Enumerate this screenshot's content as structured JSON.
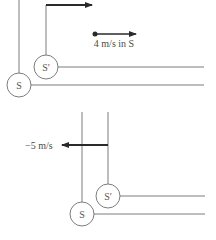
{
  "diagram": {
    "panels": [
      {
        "name": "top",
        "frames": [
          {
            "id": "S",
            "label": "S"
          },
          {
            "id": "S_prime",
            "label": "S′"
          }
        ],
        "frame_velocity_arrow": {
          "direction": "right",
          "attached_to": "S_prime"
        },
        "object": {
          "label": "4 m/s in S",
          "direction": "right"
        }
      },
      {
        "name": "bottom",
        "frames": [
          {
            "id": "S",
            "label": "S"
          },
          {
            "id": "S_prime",
            "label": "S′"
          }
        ],
        "velocity_arrow": {
          "label": "−5 m/s",
          "direction": "left",
          "attached_to": "S_prime"
        }
      }
    ]
  }
}
